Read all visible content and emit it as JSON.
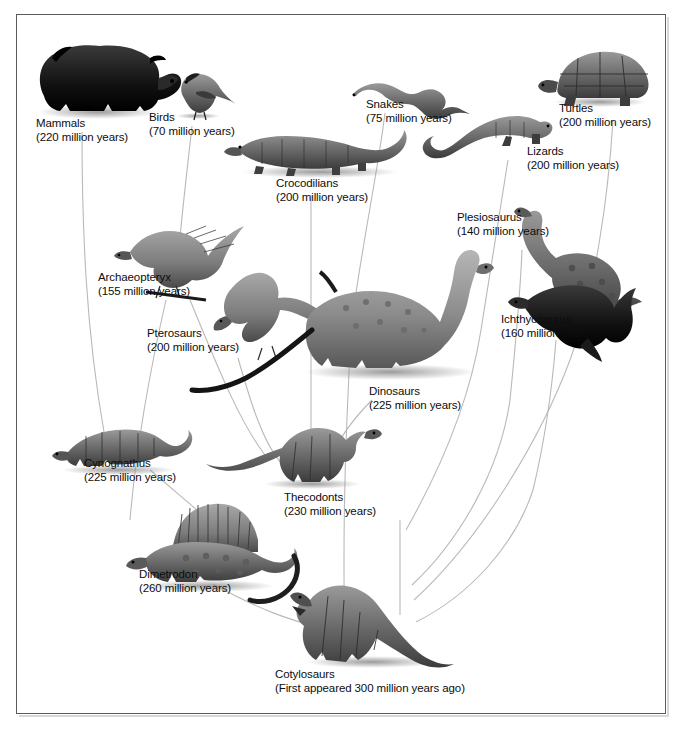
{
  "figure": {
    "background_color": "#ffffff",
    "frame_color": "#5c5c5c",
    "text_color": "#0d0d0d",
    "line_color": "#b4b4b4"
  },
  "taxa": [
    {
      "id": "mammals",
      "name": "Mammals",
      "age": "(220 million years)"
    },
    {
      "id": "birds",
      "name": "Birds",
      "age": "(70 million years)"
    },
    {
      "id": "snakes",
      "name": "Snakes",
      "age": "(75 million years)"
    },
    {
      "id": "turtles",
      "name": "Turtles",
      "age": "(200 million years)"
    },
    {
      "id": "lizards",
      "name": "Lizards",
      "age": "(200 million years)"
    },
    {
      "id": "crocodilians",
      "name": "Crocodilians",
      "age": "(200 million years)"
    },
    {
      "id": "plesiosaurus",
      "name": "Plesiosaurus",
      "age": "(140 million years)"
    },
    {
      "id": "archaeopteryx",
      "name": "Archaeopteryx",
      "age": "(155 million years)"
    },
    {
      "id": "pterosaurs",
      "name": "Pterosaurs",
      "age": "(200 million years)"
    },
    {
      "id": "ichthyosaurus",
      "name": "Ichthyosaurus",
      "age": "(160 million years)"
    },
    {
      "id": "dinosaurs",
      "name": "Dinosaurs",
      "age": "(225 million years)"
    },
    {
      "id": "cynognathus",
      "name": "Cynognathus",
      "age": "(225 million years)"
    },
    {
      "id": "thecodonts",
      "name": "Thecodonts",
      "age": "(230 million years)"
    },
    {
      "id": "dimetrodon",
      "name": "Dimetrodon",
      "age": "(260 million years)"
    },
    {
      "id": "cotylosaurs",
      "name": "Cotylosaurs",
      "age": "(First appeared 300 million years ago)"
    }
  ]
}
